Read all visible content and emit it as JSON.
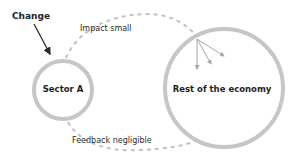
{
  "diagram": {
    "change_label": "Change",
    "nodes": [
      {
        "id": "sector-a",
        "label": "Sector A"
      },
      {
        "id": "rest-of-economy",
        "label": "Rest of the economy"
      }
    ],
    "edges": [
      {
        "from": "sector-a",
        "to": "rest-of-economy",
        "label": "Impact small",
        "style": "dashed"
      },
      {
        "from": "rest-of-economy",
        "to": "sector-a",
        "label": "Feedback negligible",
        "style": "dashed"
      }
    ],
    "colors": {
      "circle_stroke": "#c6c6c6",
      "dash_stroke": "#c2c2c2",
      "text": "#1e1e1e",
      "arrow": "#2a2a2a",
      "spread_arrows": "#a8a8a8"
    }
  }
}
